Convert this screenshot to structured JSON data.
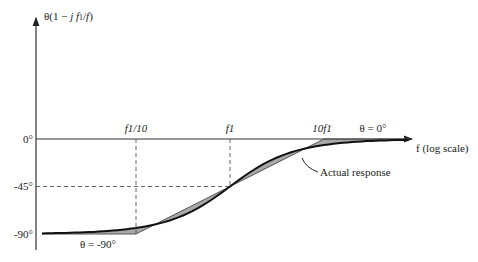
{
  "chart_data": {
    "type": "line",
    "title": "",
    "ylabel": "θ(1 − j f1/f)",
    "xlabel": "f (log scale)",
    "y_ticks": [
      "0°",
      "-45°",
      "-90°"
    ],
    "y_values": [
      0,
      -45,
      -90
    ],
    "x_ticks": [
      "f1/10",
      "f1",
      "10f1"
    ],
    "x_decades": [
      -1,
      0,
      1
    ],
    "annotations": {
      "low": "θ = -90°",
      "high": "θ = 0°",
      "actual": "Actual response"
    },
    "series": [
      {
        "name": "Asymptotic approximation",
        "points": [
          [
            -2,
            -90
          ],
          [
            -1,
            -90
          ],
          [
            0,
            -45
          ],
          [
            1,
            0
          ],
          [
            1.9,
            0
          ]
        ]
      },
      {
        "name": "Actual response",
        "function": "-90 + atan(f/f1) degrees"
      }
    ],
    "colors": {
      "line": "#222222",
      "fill": "#a8a8a8",
      "dash": "#555555"
    }
  }
}
